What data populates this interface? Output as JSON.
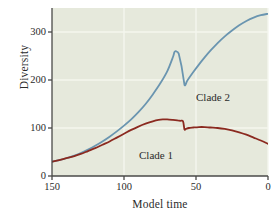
{
  "figure": {
    "background": "#ffffff",
    "plot_background": "#e6e9dc",
    "grid_color": "#f4f6ee",
    "axis_color": "#4a4a48"
  },
  "axes": {
    "ylabel": "Diversity",
    "xlabel": "Model time",
    "yticks": [
      "0",
      "100",
      "200",
      "300"
    ],
    "xticks": [
      "150",
      "100",
      "50",
      "0"
    ]
  },
  "annotations": {
    "clade2": "Clade 2",
    "clade1": "Clade 1"
  },
  "chart_data": {
    "type": "line",
    "title": "",
    "xlabel": "Model time",
    "ylabel": "Diversity",
    "xlim": [
      150,
      0
    ],
    "ylim": [
      0,
      350
    ],
    "x_axis_reversed": true,
    "grid": true,
    "legend": "inline-annotations",
    "ytick_values": [
      0,
      100,
      200,
      300
    ],
    "xtick_values": [
      150,
      100,
      50,
      0
    ],
    "series": [
      {
        "name": "Clade 2",
        "color": "#6a95b0",
        "linewidth": 1.8,
        "x": [
          150,
          145,
          140,
          135,
          130,
          125,
          120,
          115,
          110,
          105,
          100,
          95,
          90,
          85,
          80,
          75,
          70,
          66,
          65,
          64,
          62,
          60,
          58,
          56,
          52,
          48,
          44,
          40,
          35,
          30,
          25,
          20,
          15,
          10,
          5,
          0
        ],
        "y": [
          30,
          33,
          37,
          42,
          48,
          55,
          63,
          72,
          82,
          93,
          105,
          118,
          133,
          150,
          170,
          192,
          218,
          248,
          258,
          260,
          255,
          228,
          190,
          199,
          216,
          232,
          247,
          261,
          277,
          291,
          303,
          314,
          323,
          330,
          335,
          338
        ]
      },
      {
        "name": "Clade 1",
        "color": "#8b2a20",
        "linewidth": 1.8,
        "x": [
          150,
          145,
          140,
          135,
          130,
          125,
          120,
          115,
          110,
          105,
          100,
          95,
          90,
          85,
          80,
          76,
          73,
          70,
          66,
          63,
          61,
          59,
          58,
          57,
          55,
          52,
          48,
          44,
          40,
          35,
          30,
          25,
          20,
          15,
          10,
          5,
          0
        ],
        "y": [
          30,
          33,
          37,
          41,
          46,
          52,
          58,
          65,
          72,
          80,
          88,
          96,
          103,
          109,
          114,
          117,
          118,
          118,
          117,
          116,
          115,
          114,
          97,
          98,
          100,
          101,
          102,
          102,
          101,
          100,
          98,
          95,
          91,
          86,
          80,
          74,
          67
        ]
      }
    ],
    "events": [
      {
        "name": "mass-extinction",
        "at_time": 58,
        "clade2_before": 260,
        "clade2_after": 190,
        "clade1_before": 114,
        "clade1_after": 97
      }
    ]
  }
}
